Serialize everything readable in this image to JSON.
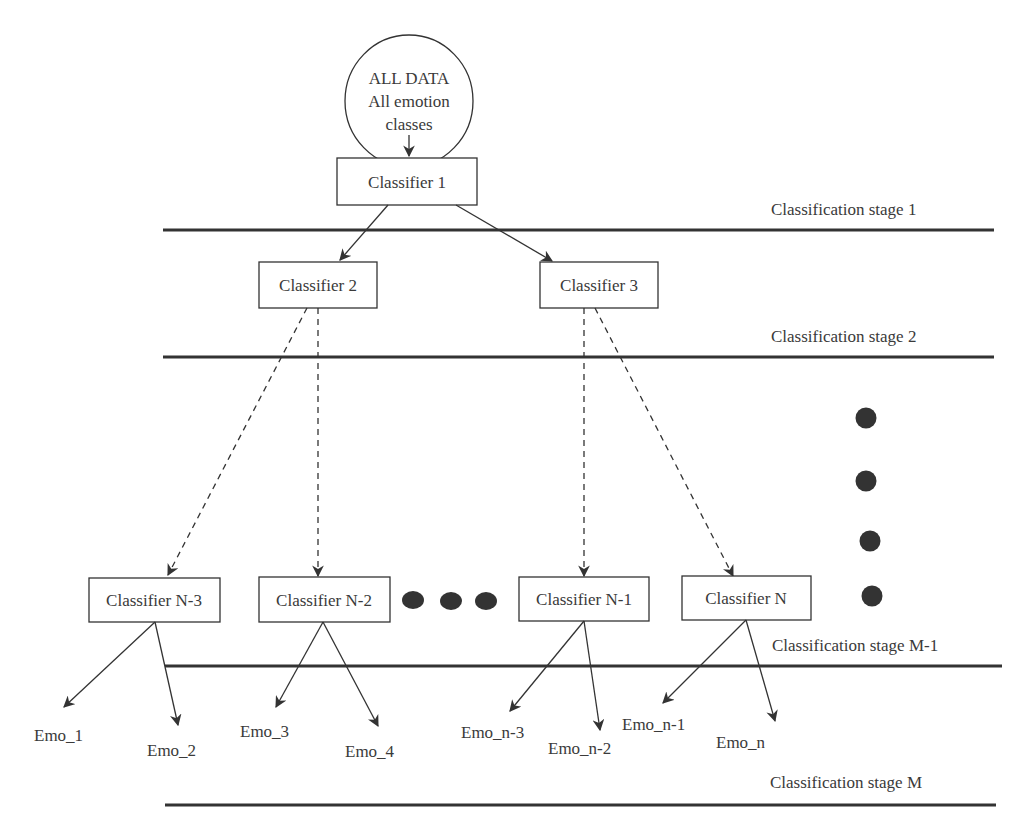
{
  "root": {
    "line1": "ALL DATA",
    "line2": "All emotion",
    "line3": "classes"
  },
  "classifiers": {
    "c1": "Classifier 1",
    "c2": "Classifier 2",
    "c3": "Classifier 3",
    "cn3": "Classifier N-3",
    "cn2": "Classifier N-2",
    "cn1": "Classifier N-1",
    "cn": "Classifier N"
  },
  "stages": {
    "s1": "Classification stage 1",
    "s2": "Classification stage 2",
    "sm1": "Classification stage M-1",
    "sm": "Classification stage M"
  },
  "emotions": {
    "e1": "Emo_1",
    "e2": "Emo_2",
    "e3": "Emo_3",
    "e4": "Emo_4",
    "en3": "Emo_n-3",
    "en2": "Emo_n-2",
    "en1": "Emo_n-1",
    "en": "Emo_n"
  },
  "colors": {
    "stroke": "#333333",
    "dot": "#333333"
  }
}
